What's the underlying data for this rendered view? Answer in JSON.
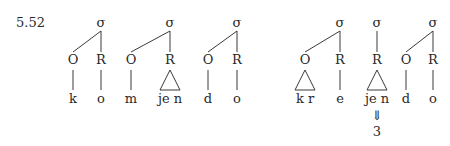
{
  "example_number": "5.52",
  "diagrams": [
    {
      "name": "komjendo",
      "syllables": [
        {
          "label": "σ",
          "constituents": [
            {
              "label": "O",
              "segments": "k",
              "branching": false
            },
            {
              "label": "R",
              "segments": "o",
              "branching": false
            }
          ]
        },
        {
          "label": "σ",
          "constituents": [
            {
              "label": "O",
              "segments": "m",
              "branching": false
            },
            {
              "label": "R",
              "segments": "je n",
              "branching": true
            }
          ]
        },
        {
          "label": "σ",
          "constituents": [
            {
              "label": "O",
              "segments": "d",
              "branching": false
            },
            {
              "label": "R",
              "segments": "o",
              "branching": false
            }
          ]
        }
      ]
    },
    {
      "name": "krejendo",
      "syllables": [
        {
          "label": "σ",
          "constituents": [
            {
              "label": "O",
              "segments": "k r",
              "branching": true
            },
            {
              "label": "R",
              "segments": "e",
              "branching": false
            }
          ]
        },
        {
          "label": "σ",
          "constituents": [
            {
              "label": "R",
              "segments": "je n",
              "branching": true,
              "derivation": {
                "arrow": "⇓",
                "result": "3"
              }
            }
          ]
        },
        {
          "label": "σ",
          "constituents": [
            {
              "label": "O",
              "segments": "d",
              "branching": false
            },
            {
              "label": "R",
              "segments": "o",
              "branching": false
            }
          ]
        }
      ]
    }
  ]
}
